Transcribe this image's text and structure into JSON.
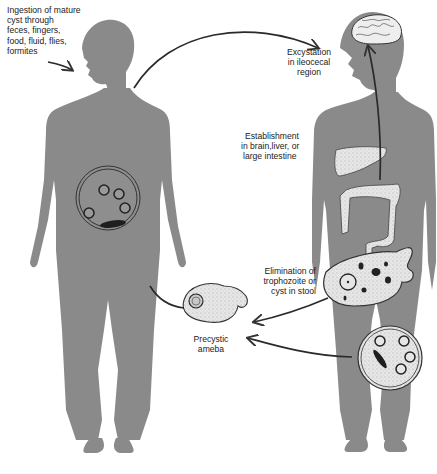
{
  "diagram": {
    "colors": {
      "body": "#8a8a8a",
      "organ": "#e4e4e4",
      "line": "#2a2a2a",
      "background": "#ffffff"
    },
    "figures": [
      "left-human-silhouette",
      "right-human-silhouette"
    ],
    "labels": {
      "ingestion": [
        "Ingestion of mature",
        "cyst through",
        "feces, fingers,",
        "food, fluid, flies,",
        "formites"
      ],
      "excystation": [
        "Excystation",
        "in ileocecal",
        "region"
      ],
      "establishment": [
        "Establishment",
        "in brain,liver, or",
        "large intestine"
      ],
      "elimination": [
        "Elimination of",
        "trophozoite or",
        "cyst in stool"
      ],
      "precystic": [
        "Precystic",
        "ameba"
      ]
    },
    "stages": [
      {
        "id": "mature-cyst",
        "location": "left figure abdomen",
        "nuclei": 4,
        "chromatoid_bars": 1
      },
      {
        "id": "trophozoite",
        "location": "right figure lower abdomen"
      },
      {
        "id": "stool-cyst",
        "location": "right figure thigh",
        "nuclei": 4,
        "chromatoid_bars": 1
      },
      {
        "id": "precystic-ameba",
        "location": "center bottom"
      }
    ],
    "arrows": [
      {
        "from": "mouth-left-figure",
        "to": "excystation",
        "direction": "left-to-right arc"
      },
      {
        "from": "intestine-right-figure",
        "to": "brain",
        "direction": "upward"
      },
      {
        "from": "trophozoite",
        "to": "precystic-ameba",
        "direction": "leftward"
      },
      {
        "from": "stool-cyst",
        "to": "precystic-ameba",
        "direction": "leftward"
      },
      {
        "from": "precystic-ameba",
        "to": "left-figure",
        "direction": "up-left"
      }
    ]
  }
}
